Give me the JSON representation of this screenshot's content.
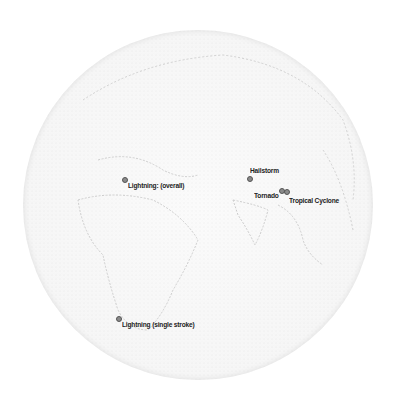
{
  "map": {
    "projection": "orthographic globe",
    "colors": {
      "land_stipple": "#c8c8c8",
      "ocean": "#f6f6f6",
      "label": "#222222",
      "marker": "#8a8a8a"
    }
  },
  "markers": [
    {
      "label": "Lightning: (overall)",
      "icon": "pin-icon"
    },
    {
      "label": "Hailstorm",
      "icon": "pin-icon"
    },
    {
      "label": "Tornado",
      "icon": "pin-icon"
    },
    {
      "label": "Tropical Cyclone",
      "icon": "pin-icon"
    },
    {
      "label": "Lightning (single stroke)",
      "icon": "pin-icon"
    }
  ]
}
